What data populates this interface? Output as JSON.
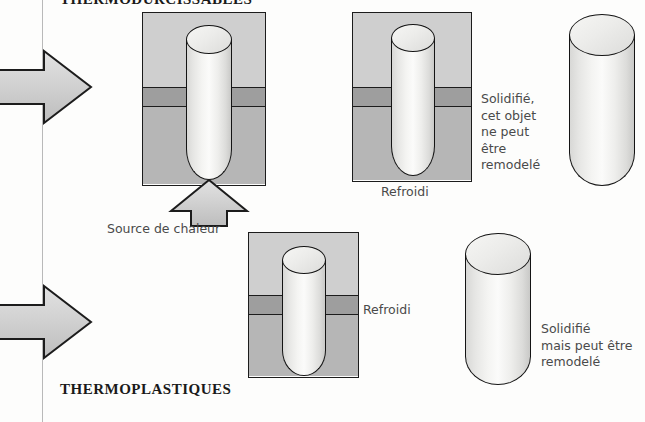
{
  "figure": {
    "sections": {
      "top_title": "THERMODURCISSABLES",
      "bottom_title": "THERMOPLASTIQUES"
    },
    "labels": {
      "heat_source": "Source de chaleur",
      "cooled_top": "Refroidi",
      "cooled_bottom": "Refroidi",
      "solid_thermoset": "Solidifié,\ncet objet\nne peut\nêtre\nremodelé",
      "solid_thermoplastic": "Solidifié\nmais peut être\nremodelé"
    },
    "icons": {
      "process_arrow_top": "right-arrow",
      "process_arrow_bottom": "right-arrow",
      "heat_arrow": "up-arrow"
    },
    "colors": {
      "background": "#fdfdfc",
      "mold_top": "#cfcfcf",
      "mold_band": "#9e9e9e",
      "mold_bottom": "#b6b6b6",
      "outline": "#1c1c1c",
      "arrow_fill": "#cdcdcd",
      "rule": "#b9b9b9",
      "text": "#4a4a4a",
      "heading_text": "#1a1a1a"
    }
  }
}
